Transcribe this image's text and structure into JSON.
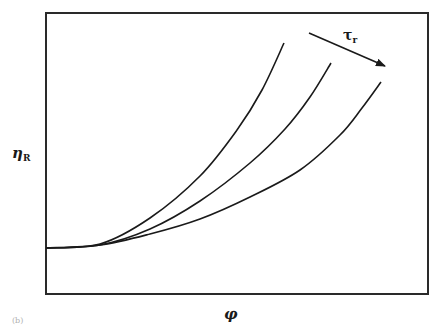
{
  "figure": {
    "panel_label": "(b)",
    "y_axis_label": "η",
    "y_axis_subscript": "R",
    "x_axis_label": "φ",
    "arrow_label": "τ",
    "arrow_subscript": "r",
    "arrow_meaning": "increasing τr shifts curves to the right",
    "colors": {
      "line": "#1a1a1a",
      "background": "#ffffff"
    }
  },
  "chart_data": {
    "type": "line",
    "title": "",
    "xlabel": "φ",
    "ylabel": "ηR",
    "ticks": "none",
    "grid": false,
    "legend": "none (arrow annotation τr indicates increasing direction)",
    "frame_px": {
      "left": 46,
      "top": 13,
      "right": 428,
      "bottom": 294
    },
    "series": [
      {
        "name": "τr low",
        "points_px": [
          [
            46,
            248
          ],
          [
            100,
            244
          ],
          [
            150,
            218
          ],
          [
            200,
            176
          ],
          [
            237,
            130
          ],
          [
            262,
            90
          ],
          [
            284,
            43
          ]
        ]
      },
      {
        "name": "τr mid",
        "points_px": [
          [
            46,
            248
          ],
          [
            100,
            245
          ],
          [
            150,
            229
          ],
          [
            200,
            201
          ],
          [
            250,
            163
          ],
          [
            285,
            129
          ],
          [
            310,
            97
          ],
          [
            331,
            63
          ]
        ]
      },
      {
        "name": "τr high",
        "points_px": [
          [
            46,
            248
          ],
          [
            100,
            245
          ],
          [
            150,
            234
          ],
          [
            200,
            219
          ],
          [
            250,
            197
          ],
          [
            300,
            170
          ],
          [
            340,
            135
          ],
          [
            362,
            108
          ],
          [
            381,
            82
          ]
        ]
      }
    ],
    "arrow_px": {
      "from": [
        309,
        33
      ],
      "to": [
        385,
        66
      ]
    }
  }
}
